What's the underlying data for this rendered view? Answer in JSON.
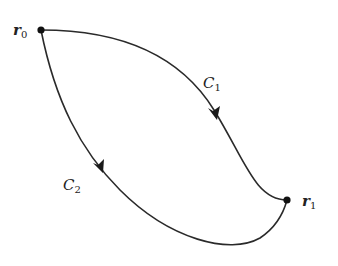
{
  "diagram": {
    "type": "path-diagram",
    "points": {
      "r0": {
        "label": "r",
        "subscript": "0",
        "x": 41,
        "y": 30
      },
      "r1": {
        "label": "r",
        "subscript": "1",
        "x": 287,
        "y": 200
      }
    },
    "curves": {
      "c1": {
        "label": "C",
        "subscript": "1",
        "direction": "r0 to r1"
      },
      "c2": {
        "label": "C",
        "subscript": "2",
        "direction": "r0 to r1"
      }
    },
    "colors": {
      "stroke": "#2a2a2a",
      "point": "#111111",
      "background": "#ffffff"
    }
  }
}
